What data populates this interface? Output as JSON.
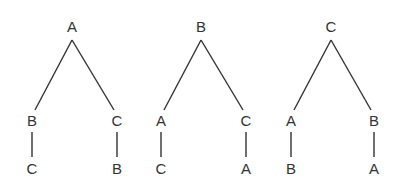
{
  "trees": [
    {
      "root": {
        "label": "A",
        "x": 72,
        "y": 32
      },
      "left": {
        "label": "B",
        "x": 32,
        "y": 126,
        "child": {
          "label": "C",
          "x": 32,
          "y": 174
        }
      },
      "right": {
        "label": "C",
        "x": 117,
        "y": 126,
        "child": {
          "label": "B",
          "x": 117,
          "y": 174
        }
      }
    },
    {
      "root": {
        "label": "B",
        "x": 201,
        "y": 32
      },
      "left": {
        "label": "A",
        "x": 161,
        "y": 126,
        "child": {
          "label": "C",
          "x": 161,
          "y": 174
        }
      },
      "right": {
        "label": "C",
        "x": 246,
        "y": 126,
        "child": {
          "label": "A",
          "x": 246,
          "y": 174
        }
      }
    },
    {
      "root": {
        "label": "C",
        "x": 331,
        "y": 32
      },
      "left": {
        "label": "A",
        "x": 291,
        "y": 126,
        "child": {
          "label": "B",
          "x": 291,
          "y": 174
        }
      },
      "right": {
        "label": "B",
        "x": 374,
        "y": 126,
        "child": {
          "label": "A",
          "x": 374,
          "y": 174
        }
      }
    }
  ]
}
